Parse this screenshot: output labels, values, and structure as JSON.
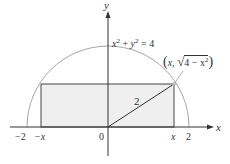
{
  "figure": {
    "type": "diagram",
    "axes": {
      "x_label": "x",
      "y_label": "y",
      "origin_label": "0"
    },
    "circle": {
      "equation": "x² + y² = 4",
      "eq_x": "x",
      "eq_sup1": "2",
      "eq_plus": " + ",
      "eq_y": "y",
      "eq_sup2": "2",
      "eq_rest": " = 4",
      "radius": 2
    },
    "tick_labels": {
      "neg_two": "−2",
      "neg_x": "−x",
      "x": "x",
      "two": "2"
    },
    "point_label": {
      "text": "(x, √(4 − x²))",
      "open": "(",
      "x": "x",
      "comma": ", ",
      "radical": "4 − x",
      "sup": "2",
      "close": ")"
    },
    "radius_label": "2",
    "colors": {
      "axis": "#333333",
      "circle": "#a6a6a6",
      "rectangle_fill": "#efefef",
      "rectangle_stroke": "#444444",
      "text": "#333333"
    }
  }
}
